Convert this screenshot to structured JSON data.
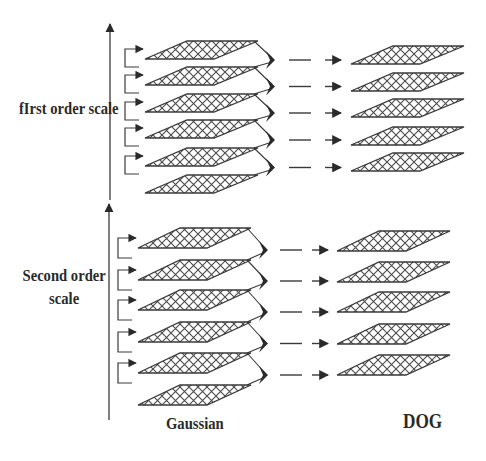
{
  "diagram": {
    "type": "scale-space pyramid (Gaussian to Difference-of-Gaussian)",
    "groups": [
      {
        "id": "first",
        "label": "fIrst order scale",
        "gaussian_layers": 6,
        "dog_layers": 5
      },
      {
        "id": "second",
        "label_lines": [
          "Second order",
          "scale"
        ],
        "gaussian_layers": 6,
        "dog_layers": 5
      }
    ],
    "column_labels": {
      "gaussian": "Gaussian",
      "dog": "DOG"
    },
    "colors": {
      "line": "#3a3a3a",
      "text": "#2a2a2a",
      "background": "#ffffff"
    }
  }
}
